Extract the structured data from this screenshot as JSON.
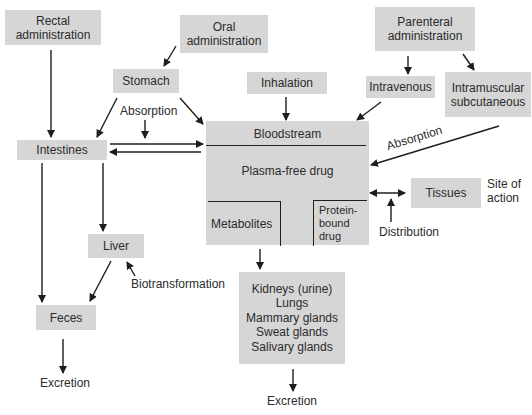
{
  "diagram": {
    "type": "flowchart",
    "nodes": {
      "rectal": "Rectal administration",
      "rectal_l1": "Rectal",
      "rectal_l2": "administration",
      "oral_l1": "Oral",
      "oral_l2": "administration",
      "parenteral_l1": "Parenteral",
      "parenteral_l2": "administration",
      "stomach": "Stomach",
      "inhalation": "Inhalation",
      "intravenous": "Intravenous",
      "im_sc_l1": "Intramuscular",
      "im_sc_l2": "subcutaneous",
      "intestines": "Intestines",
      "bloodstream": "Bloodstream",
      "plasma_free": "Plasma-free drug",
      "metabolites": "Metabolites",
      "protein_l1": "Protein-",
      "protein_l2": "bound",
      "protein_l3": "drug",
      "tissues": "Tissues",
      "liver": "Liver",
      "feces": "Feces",
      "excretion_organs": [
        "Kidneys (urine)",
        "Lungs",
        "Mammary glands",
        "Sweat glands",
        "Salivary glands"
      ]
    },
    "labels": {
      "absorption_left": "Absorption",
      "absorption_right": "Absorption",
      "site_l1": "Site of",
      "site_l2": "action",
      "distribution": "Distribution",
      "biotransformation": "Biotransformation",
      "excretion_left": "Excretion",
      "excretion_bottom": "Excretion"
    },
    "edges": [
      [
        "Rectal administration",
        "Intestines"
      ],
      [
        "Oral administration",
        "Stomach"
      ],
      [
        "Stomach",
        "Intestines"
      ],
      [
        "Stomach",
        "Bloodstream"
      ],
      [
        "Intestines",
        "Bloodstream"
      ],
      [
        "Bloodstream",
        "Intestines"
      ],
      [
        "Inhalation",
        "Bloodstream"
      ],
      [
        "Parenteral administration",
        "Intravenous"
      ],
      [
        "Parenteral administration",
        "Intramuscular subcutaneous"
      ],
      [
        "Intravenous",
        "Bloodstream"
      ],
      [
        "Intramuscular subcutaneous",
        "Plasma-free drug"
      ],
      [
        "Plasma-free drug",
        "Protein-bound drug"
      ],
      [
        "Bloodstream",
        "Tissues"
      ],
      [
        "Intestines",
        "Liver"
      ],
      [
        "Intestines",
        "Feces"
      ],
      [
        "Liver",
        "Feces"
      ],
      [
        "Metabolites",
        "Kidneys / Lungs / Glands"
      ],
      [
        "Kidneys / Lungs / Glands",
        "Excretion"
      ],
      [
        "Feces",
        "Excretion"
      ]
    ],
    "colors": {
      "box": "#d6d6d6",
      "line": "#1e1e1e",
      "text": "#2b2b2b"
    }
  }
}
